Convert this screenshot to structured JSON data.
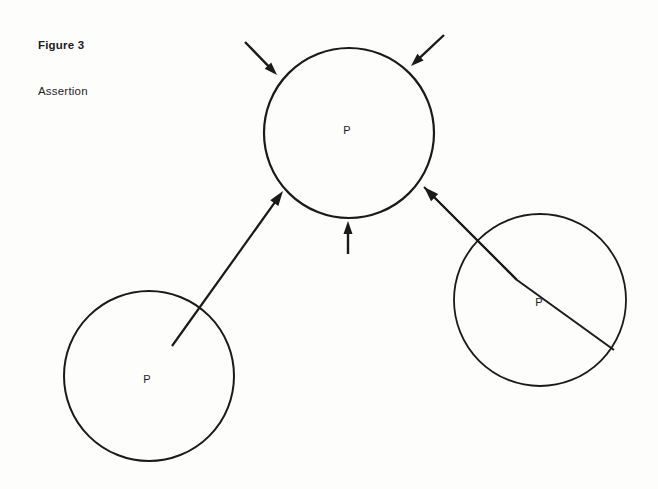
{
  "figure": {
    "title": "Figure 3",
    "subtitle": "Assertion",
    "background_color": "#fdfdfc",
    "ink_color": "#1a1a1a"
  },
  "diagram_data": {
    "type": "diagram",
    "description": "Three circular nodes each labeled P; arrows converge on the upper node.",
    "nodes": [
      {
        "id": "node-top",
        "label": "P",
        "cx": 349,
        "cy": 133,
        "r": 85,
        "stroke_width": 2.2,
        "label_x": 347,
        "label_y": 131
      },
      {
        "id": "node-bottom-left",
        "label": "P",
        "cx": 149,
        "cy": 376,
        "r": 85,
        "stroke_width": 2.0,
        "label_x": 147,
        "label_y": 380
      },
      {
        "id": "node-right",
        "label": "P",
        "cx": 540,
        "cy": 300,
        "r": 86,
        "stroke_width": 1.8,
        "label_x": 539,
        "label_y": 303
      }
    ],
    "arrows": [
      {
        "id": "arrow-top-left-inbound",
        "from": [
          245,
          42
        ],
        "to": [
          277,
          75
        ],
        "stroke_width": 2.4,
        "head_length": 13,
        "head_width": 9,
        "target": "node-top"
      },
      {
        "id": "arrow-top-right-inbound",
        "from": [
          444,
          35
        ],
        "to": [
          411,
          66
        ],
        "stroke_width": 2.4,
        "head_length": 13,
        "head_width": 9,
        "target": "node-top"
      },
      {
        "id": "arrow-bottom-vertical-inbound",
        "from": [
          348,
          254
        ],
        "to": [
          348,
          221
        ],
        "stroke_width": 2.4,
        "head_length": 13,
        "head_width": 9,
        "target": "node-top"
      },
      {
        "id": "arrow-lower-right-inbound",
        "from": [
          614,
          350
        ],
        "to": [
          424,
          187
        ],
        "stroke_width": 2.0,
        "head_length": 15,
        "head_width": 10,
        "target": "node-top",
        "note": "long arrow originating from right circle interior"
      },
      {
        "id": "arrow-bottom-left-to-top",
        "from": [
          172,
          346
        ],
        "to": [
          283,
          191
        ],
        "stroke_width": 2.2,
        "head_length": 15,
        "head_width": 10,
        "source": "node-bottom-left",
        "target": "node-top"
      }
    ],
    "short_arrow_right_tail": {
      "id": "arrow-right-circle-tail",
      "from": [
        517,
        280
      ],
      "to": [
        424,
        187
      ],
      "stroke_width": 2.0
    }
  }
}
